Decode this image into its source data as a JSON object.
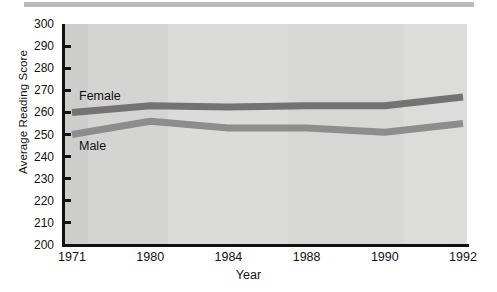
{
  "chart_data": {
    "type": "line",
    "title": "",
    "xlabel": "Year",
    "ylabel": "Average Reading Score",
    "categories": [
      "1971",
      "1980",
      "1984",
      "1988",
      "1990",
      "1992"
    ],
    "ylim": [
      200,
      300
    ],
    "ytick_step": 10,
    "yticks": [
      300,
      290,
      280,
      270,
      260,
      250,
      240,
      230,
      220,
      210,
      200
    ],
    "grid": false,
    "legend_position": "inline-labels",
    "series": [
      {
        "name": "Female",
        "color": "#737373",
        "values": [
          260,
          263,
          262.5,
          263,
          263,
          267
        ]
      },
      {
        "name": "Male",
        "color": "#8d8d8d",
        "values": [
          250,
          256,
          253,
          253,
          251,
          255
        ]
      }
    ],
    "annotations": [
      {
        "text": "Female",
        "series": "Female"
      },
      {
        "text": "Male",
        "series": "Male"
      }
    ]
  },
  "axes": {
    "y_title": "Average Reading Score",
    "x_title": "Year"
  },
  "colors": {
    "plot_background": "#d8d8d6",
    "axis": "#111111",
    "female_line": "#737373",
    "male_line": "#8d8d8d",
    "top_bar": "#b9b9b9"
  }
}
